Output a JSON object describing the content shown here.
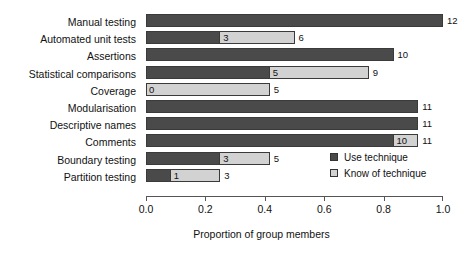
{
  "chart_data": {
    "type": "bar",
    "orientation": "horizontal",
    "stacked": true,
    "title": "",
    "xlabel": "Proportion of group members",
    "ylabel": "",
    "xlim": [
      0.0,
      1.0
    ],
    "group_size": 12,
    "grid": false,
    "legend_position": "inside-right",
    "xticks": [
      "0.0",
      "0.2",
      "0.4",
      "0.6",
      "0.8",
      "1.0"
    ],
    "xtick_values": [
      0.0,
      0.2,
      0.4,
      0.6,
      0.8,
      1.0
    ],
    "categories": [
      "Manual testing",
      "Automated unit tests",
      "Assertions",
      "Statistical comparisons",
      "Coverage",
      "Modularisation",
      "Descriptive names",
      "Comments",
      "Boundary testing",
      "Partition testing"
    ],
    "series": [
      {
        "name": "Use technique",
        "color": "#4a4a4a",
        "values": [
          12,
          3,
          10,
          5,
          0,
          11,
          11,
          10,
          3,
          1
        ]
      },
      {
        "name": "Know of technique",
        "color": "#d2d2d2",
        "values": [
          12,
          6,
          10,
          9,
          5,
          11,
          11,
          11,
          5,
          3
        ]
      }
    ],
    "rows": [
      {
        "label": "Manual testing",
        "use": 12,
        "know": 12,
        "use_label": "",
        "know_label": "",
        "end_label": "12"
      },
      {
        "label": "Automated unit tests",
        "use": 3,
        "know": 6,
        "use_label": "3",
        "know_label": "",
        "end_label": "6"
      },
      {
        "label": "Assertions",
        "use": 10,
        "know": 10,
        "use_label": "",
        "know_label": "",
        "end_label": "10"
      },
      {
        "label": "Statistical comparisons",
        "use": 5,
        "know": 9,
        "use_label": "5",
        "know_label": "",
        "end_label": "9"
      },
      {
        "label": "Coverage",
        "use": 0,
        "know": 5,
        "use_label": "0",
        "know_label": "",
        "end_label": "5"
      },
      {
        "label": "Modularisation",
        "use": 11,
        "know": 11,
        "use_label": "",
        "know_label": "",
        "end_label": "11"
      },
      {
        "label": "Descriptive names",
        "use": 11,
        "know": 11,
        "use_label": "",
        "know_label": "",
        "end_label": "11"
      },
      {
        "label": "Comments",
        "use": 10,
        "know": 11,
        "use_label": "10",
        "know_label": "",
        "end_label": "11"
      },
      {
        "label": "Boundary testing",
        "use": 3,
        "know": 5,
        "use_label": "3",
        "know_label": "",
        "end_label": "5"
      },
      {
        "label": "Partition testing",
        "use": 1,
        "know": 3,
        "use_label": "1",
        "know_label": "",
        "end_label": "3"
      }
    ]
  },
  "legend": {
    "items": [
      {
        "label": "Use technique",
        "color": "#4a4a4a"
      },
      {
        "label": "Know of technique",
        "color": "#d2d2d2"
      }
    ]
  }
}
